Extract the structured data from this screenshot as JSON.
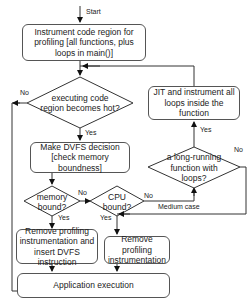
{
  "start_label": "Start",
  "boxes": {
    "instrument": "Instrument code region for profiling [all functions, plus  loops in main()]",
    "dvfs_decision": "Make DVFS decision [check memory boundness]",
    "jit": "JIT and  instrument all loops inside the function",
    "remove_insert": "Remove profiling instrumentation and insert DVFS instruction",
    "remove": "Remove profiling instrumentation",
    "app_exec": "Application execution"
  },
  "decisions": {
    "hot": "executing code region becomes hot?",
    "long_running": "a long-running function with loops?",
    "memory_bound": "memory bound?",
    "cpu_bound": "CPU bound?"
  },
  "edge_labels": {
    "hot_no": "No",
    "hot_yes": "Yes",
    "long_yes": "Yes",
    "long_no": "No",
    "mem_no": "No",
    "mem_yes": "Yes",
    "cpu_no": "No",
    "cpu_yes": "Yes",
    "medium_case": "Medium case"
  }
}
